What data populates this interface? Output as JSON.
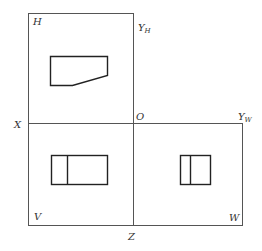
{
  "labels": {
    "H": "H",
    "V": "V",
    "W": "W",
    "X": "X",
    "Z": "Z",
    "O": "O",
    "YH_main": "Y",
    "YH_sub": "H",
    "YW_main": "Y",
    "YW_sub": "W"
  },
  "views": {
    "top_view": {
      "plane": "H",
      "outline": "pentagon (rectangle with chamfered lower-right corner)"
    },
    "front_view": {
      "plane": "V",
      "outline": "rectangle with one vertical division line"
    },
    "side_view": {
      "plane": "W",
      "outline": "rectangle with one vertical division line"
    }
  },
  "colors": {
    "frame": "#555555",
    "shape": "#222222",
    "text": "#333333",
    "background": "#ffffff"
  }
}
